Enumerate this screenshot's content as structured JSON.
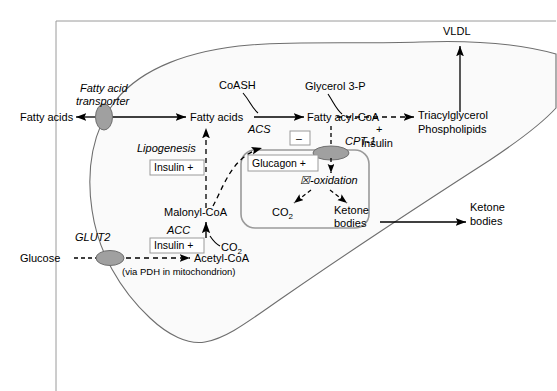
{
  "figure": {
    "frame_color": "#9a9a9a",
    "cell_outline_color": "#6e6e6e",
    "cell_fill_color": "#fafafa",
    "transporter_fill": "#a0a0a0",
    "arrow_color": "#000000",
    "box_border_color": "#9a9a9a"
  },
  "extracellular": {
    "fatty_acids_label": "Fatty acids",
    "glucose_label": "Glucose",
    "ketone_bodies_label_line1": "Ketone",
    "ketone_bodies_label_line2": "bodies",
    "vldl_label": "VLDL"
  },
  "transporters": {
    "fatty_acid_transporter_line1": "Fatty acid",
    "fatty_acid_transporter_line2": "transporter",
    "glut2_label": "GLUT2",
    "cpt1_label": "CPT-1"
  },
  "cytosol": {
    "fatty_acids_label": "Fatty acids",
    "fatty_acyl_coa_label": "Fatty acyl-CoA",
    "coash_label": "CoASH",
    "acs_label": "ACS",
    "lipogenesis_label": "Lipogenesis",
    "lipogenesis_insulin_box": "Insulin +",
    "malonyl_coa_label": "Malonyl-CoA",
    "acc_label": "ACC",
    "acc_insulin_box": "Insulin +",
    "co2_label": "CO",
    "co2_subscript": "2",
    "acetyl_coa_label": "Acetyl-CoA",
    "pdh_note": "(via PDH in mitochondrion)",
    "glycerol_3p_label": "Glycerol 3-P",
    "insulin_plus_sign": "+",
    "insulin_label": "Insulin",
    "triacylglycerol_label": "Triacylglycerol",
    "phospholipids_label": "Phospholipids",
    "inhibition_sign": "–"
  },
  "mitochondrion": {
    "glucagon_box": "Glucagon +",
    "beta_oxidation_label": "☒-oxidation",
    "co2_label": "CO",
    "co2_subscript": "2",
    "ketone_bodies_line1": "Ketone",
    "ketone_bodies_line2": "bodies"
  }
}
